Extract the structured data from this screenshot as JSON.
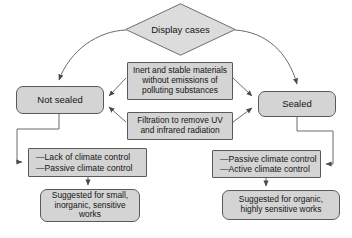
{
  "diagram": {
    "background": "#ffffff",
    "node_fill": "#d4d4d4",
    "node_stroke": "#5a5a5a",
    "edge_color": "#555555",
    "text_color": "#141414"
  },
  "nodes": {
    "root": {
      "label": "Display cases",
      "shape": "diamond"
    },
    "not_sealed": {
      "label": "Not sealed",
      "shape": "rounded-rect"
    },
    "sealed": {
      "label": "Sealed",
      "shape": "rounded-rect"
    },
    "requirement_materials": {
      "line1": "Inert and stable materials",
      "line2": "without emissions of",
      "line3": "polluting substances",
      "shape": "rect"
    },
    "requirement_filtration": {
      "line1": "Filtration to remove UV",
      "line2": "and infrared radiation",
      "shape": "rect"
    },
    "climate_left": {
      "line1": "—Lack of climate control",
      "line2": "—Passive climate control",
      "shape": "rect"
    },
    "climate_right": {
      "line1": "—Passive climate control",
      "line2": "—Active climate control",
      "shape": "rect"
    },
    "suggestion_left": {
      "line1": "Suggested for small,",
      "line2": "inorganic, sensitive",
      "line3": "works",
      "shape": "rounded-rect"
    },
    "suggestion_right": {
      "line1": "Suggested for organic,",
      "line2": "highly sensitive works",
      "shape": "rounded-rect"
    }
  },
  "edges": [
    {
      "from": "root",
      "to": "not_sealed",
      "style": "curved",
      "arrow": "down"
    },
    {
      "from": "root",
      "to": "sealed",
      "style": "curved",
      "arrow": "down"
    },
    {
      "from": "requirement_materials",
      "to": "not_sealed",
      "style": "straight",
      "arrow": "left"
    },
    {
      "from": "requirement_filtration",
      "to": "not_sealed",
      "style": "straight",
      "arrow": "left"
    },
    {
      "from": "requirement_materials",
      "to": "sealed",
      "style": "straight",
      "arrow": "right"
    },
    {
      "from": "requirement_filtration",
      "to": "sealed",
      "style": "straight",
      "arrow": "right"
    },
    {
      "from": "not_sealed",
      "to": "climate_left",
      "style": "orthogonal",
      "arrow": "right"
    },
    {
      "from": "sealed",
      "to": "climate_right",
      "style": "orthogonal",
      "arrow": "left"
    },
    {
      "from": "climate_left",
      "to": "suggestion_left",
      "style": "straight",
      "arrow": "down"
    },
    {
      "from": "climate_right",
      "to": "suggestion_right",
      "style": "straight",
      "arrow": "down"
    }
  ]
}
